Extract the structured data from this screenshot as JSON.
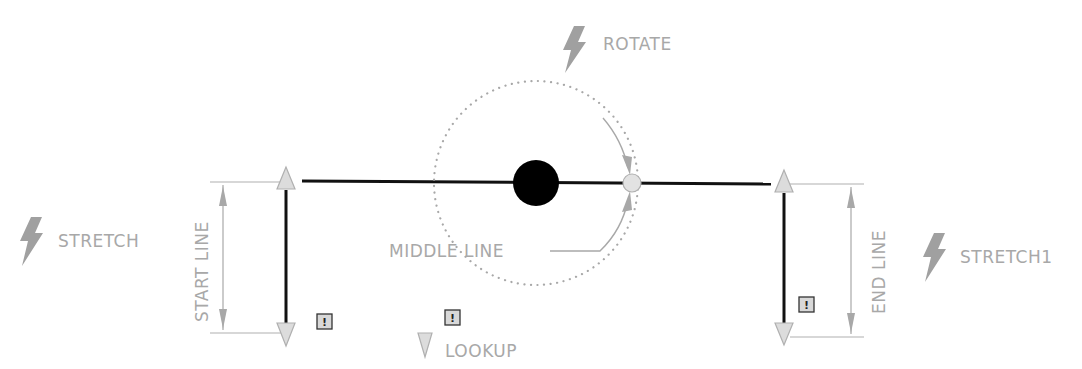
{
  "diagram": {
    "type": "cad-dynamic-block",
    "colors": {
      "geometry": "#000000",
      "annotation": "#a8a8a8",
      "grip_fill": "#dcdcdc",
      "action_icon": "#a0a0a0",
      "alert_fill": "#d8d8d8"
    },
    "actions": {
      "rotate": {
        "label": "ROTATE",
        "icon": "lightning-bolt-icon"
      },
      "stretch": {
        "label": "STRETCH",
        "icon": "lightning-bolt-icon"
      },
      "stretch1": {
        "label": "STRETCH1",
        "icon": "lightning-bolt-icon"
      },
      "lookup": {
        "label": "LOOKUP",
        "icon": "lookup-triangle-icon"
      }
    },
    "parameters": {
      "start_line": {
        "label": "START LINE"
      },
      "middle_line": {
        "label": "MIDDLE LINE"
      },
      "end_line": {
        "label": "END LINE"
      }
    },
    "alerts": [
      {
        "symbol": "!"
      },
      {
        "symbol": "!"
      },
      {
        "symbol": "!"
      }
    ]
  }
}
